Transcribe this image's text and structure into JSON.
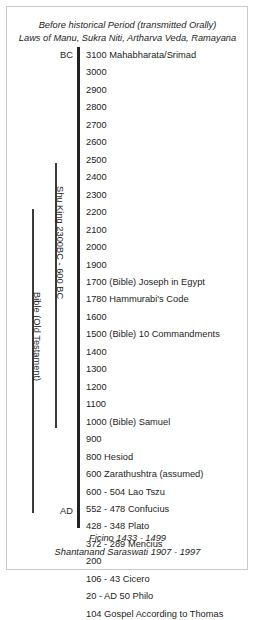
{
  "header": {
    "lines": [
      "Before historical Period (transmitted Orally)",
      "Laws of Manu, Sukra Niti, Artharva Veda, Ramayana"
    ]
  },
  "timeline": {
    "era_start_label": "BC",
    "era_end_label": "AD",
    "axis_color": "#222222",
    "rows": [
      {
        "year": "3100",
        "event": "Mahabharata/Srimad"
      },
      {
        "year": "3000",
        "event": ""
      },
      {
        "year": "2900",
        "event": ""
      },
      {
        "year": "2800",
        "event": ""
      },
      {
        "year": "2700",
        "event": ""
      },
      {
        "year": "2600",
        "event": ""
      },
      {
        "year": "2500",
        "event": ""
      },
      {
        "year": "2400",
        "event": ""
      },
      {
        "year": "2300",
        "event": ""
      },
      {
        "year": "2200",
        "event": ""
      },
      {
        "year": "2100",
        "event": ""
      },
      {
        "year": "2000",
        "event": ""
      },
      {
        "year": "1900",
        "event": ""
      },
      {
        "year": "1700",
        "event": "(Bible) Joseph in Egypt"
      },
      {
        "year": "1780",
        "event": "Hammurabi's Code"
      },
      {
        "year": "1600",
        "event": ""
      },
      {
        "year": "1500",
        "event": "(Bible) 10 Commandments"
      },
      {
        "year": "1400",
        "event": ""
      },
      {
        "year": "1300",
        "event": ""
      },
      {
        "year": "1200",
        "event": ""
      },
      {
        "year": "1100",
        "event": ""
      },
      {
        "year": "1000",
        "event": "(Bible) Samuel"
      },
      {
        "year": "900",
        "event": ""
      },
      {
        "year": "800",
        "event": "Hesiod"
      },
      {
        "year": "600",
        "event": " Zarathushtra (assumed)"
      },
      {
        "year": "600 - 504",
        "event": "Lao Tszu"
      },
      {
        "year": "552 - 478",
        "event": "Confucius"
      },
      {
        "year": "428 - 348",
        "event": "Plato"
      },
      {
        "year": "372 - 289",
        "event": "Mencius"
      },
      {
        "year": "200",
        "event": ""
      },
      {
        "year": "106 - 43",
        "event": "Cicero"
      },
      {
        "year": "20 - AD 50",
        "event": " Philo"
      },
      {
        "year": "104",
        "event": "Gospel According to Thomas"
      }
    ]
  },
  "brackets": [
    {
      "label": "Shu King 2300BC - 600 BC"
    },
    {
      "label": "Bible (Old Testament)"
    }
  ],
  "footer": {
    "lines": [
      "Ficino 1433 - 1499",
      "Shantanand Saraswati 1907 - 1997"
    ]
  }
}
